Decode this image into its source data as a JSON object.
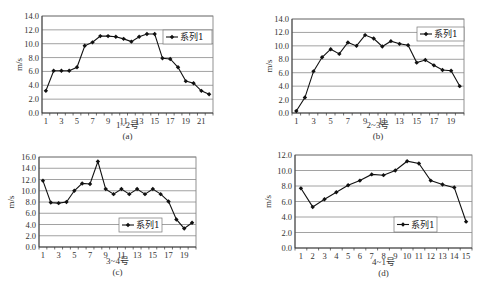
{
  "chart_data": [
    {
      "type": "line",
      "id": "a",
      "caption": "(a)",
      "xlabel": "1~2号",
      "ylabel": "m/s",
      "ylim": [
        0,
        14
      ],
      "yticks": [
        0.0,
        2.0,
        4.0,
        6.0,
        8.0,
        10.0,
        12.0,
        14.0
      ],
      "x": [
        1,
        2,
        3,
        4,
        5,
        6,
        7,
        8,
        9,
        10,
        11,
        12,
        13,
        14,
        15,
        16,
        17,
        18,
        19,
        20,
        21,
        22
      ],
      "xtick_labels": [
        "1",
        "3",
        "5",
        "7",
        "9",
        "11",
        "13",
        "15",
        "17",
        "19",
        "21"
      ],
      "xtick_step": 2,
      "legend": "系列1",
      "legend_position": "upper right",
      "grid": true,
      "series": [
        {
          "name": "系列1",
          "values": [
            3.2,
            6.1,
            6.1,
            6.1,
            6.6,
            9.7,
            10.2,
            11.1,
            11.1,
            11.0,
            10.7,
            10.3,
            11.0,
            11.4,
            11.4,
            7.9,
            7.8,
            6.6,
            4.6,
            4.3,
            3.2,
            2.7
          ]
        }
      ]
    },
    {
      "type": "line",
      "id": "b",
      "caption": "(b)",
      "xlabel": "2~3号",
      "ylabel": "m/s",
      "ylim": [
        0,
        14
      ],
      "yticks": [
        0.0,
        2.0,
        4.0,
        6.0,
        8.0,
        10.0,
        12.0,
        14.0
      ],
      "x": [
        1,
        2,
        3,
        4,
        5,
        6,
        7,
        8,
        9,
        10,
        11,
        12,
        13,
        14,
        15,
        16,
        17,
        18,
        19,
        20
      ],
      "xtick_labels": [
        "1",
        "3",
        "5",
        "7",
        "9",
        "11",
        "13",
        "15",
        "17",
        "19"
      ],
      "xtick_step": 2,
      "legend": "系列1",
      "legend_position": "upper right",
      "grid": true,
      "series": [
        {
          "name": "系列1",
          "values": [
            0.3,
            2.3,
            6.2,
            8.3,
            9.5,
            8.8,
            10.5,
            10.0,
            11.6,
            11.1,
            9.9,
            10.7,
            10.3,
            10.1,
            7.5,
            7.9,
            7.1,
            6.4,
            6.3,
            4.0
          ]
        }
      ]
    },
    {
      "type": "line",
      "id": "c",
      "caption": "(c)",
      "xlabel": "3~4号",
      "ylabel": "m/s",
      "ylim": [
        0,
        16
      ],
      "yticks": [
        0.0,
        2.0,
        4.0,
        6.0,
        8.0,
        10.0,
        12.0,
        14.0,
        16.0
      ],
      "x": [
        1,
        2,
        3,
        4,
        5,
        6,
        7,
        8,
        9,
        10,
        11,
        12,
        13,
        14,
        15,
        16,
        17,
        18,
        19,
        20
      ],
      "xtick_labels": [
        "1",
        "3",
        "5",
        "7",
        "9",
        "11",
        "13",
        "15",
        "17",
        "19"
      ],
      "xtick_step": 2,
      "legend": "系列1",
      "legend_position": "lower right",
      "grid": true,
      "series": [
        {
          "name": "系列1",
          "values": [
            11.8,
            7.9,
            7.8,
            8.0,
            10.0,
            11.3,
            11.2,
            15.2,
            10.3,
            9.4,
            10.3,
            9.4,
            10.3,
            9.4,
            10.3,
            9.4,
            8.1,
            4.9,
            3.3,
            4.3
          ]
        }
      ]
    },
    {
      "type": "line",
      "id": "d",
      "caption": "(d)",
      "xlabel": "4~1号",
      "ylabel": "m/s",
      "ylim": [
        0,
        12
      ],
      "yticks": [
        0.0,
        2.0,
        4.0,
        6.0,
        8.0,
        10.0,
        12.0
      ],
      "x": [
        1,
        2,
        3,
        4,
        5,
        6,
        7,
        8,
        9,
        10,
        11,
        12,
        13,
        14,
        15
      ],
      "xtick_labels": [
        "1",
        "2",
        "3",
        "4",
        "5",
        "6",
        "7",
        "8",
        "9",
        "10",
        "11",
        "12",
        "13",
        "14",
        "15"
      ],
      "xtick_step": 1,
      "legend": "系列1",
      "legend_position": "lower right",
      "grid": true,
      "series": [
        {
          "name": "系列1",
          "values": [
            7.7,
            5.3,
            6.3,
            7.2,
            8.1,
            8.7,
            9.5,
            9.4,
            10.0,
            11.2,
            10.9,
            8.7,
            8.2,
            7.8,
            3.4
          ]
        }
      ]
    }
  ],
  "layout": {
    "panels": [
      {
        "plot": {
          "left": 42,
          "top": 16,
          "right": 213,
          "bottom": 113
        },
        "legend": {
          "x": 163,
          "y": 30,
          "w": 49,
          "h": 14
        },
        "xlabel_y": 128,
        "caption_y": 139,
        "ylabel_x": 22
      },
      {
        "plot": {
          "left": 292,
          "top": 19,
          "right": 464,
          "bottom": 113
        },
        "legend": {
          "x": 417,
          "y": 27,
          "w": 47,
          "h": 14
        },
        "xlabel_y": 128,
        "caption_y": 139,
        "ylabel_x": 272
      },
      {
        "plot": {
          "left": 39,
          "top": 157,
          "right": 196,
          "bottom": 247
        },
        "legend": {
          "x": 119,
          "y": 218,
          "w": 43,
          "h": 14
        },
        "xlabel_y": 264,
        "caption_y": 275,
        "ylabel_x": 14
      },
      {
        "plot": {
          "left": 295,
          "top": 155,
          "right": 472,
          "bottom": 248
        },
        "legend": {
          "x": 394,
          "y": 217,
          "w": 43,
          "h": 15
        },
        "xlabel_y": 265,
        "caption_y": 276,
        "ylabel_x": 271
      }
    ],
    "colors": {
      "line": "#111111",
      "grid": "#8a8a8a",
      "frame": "#777777",
      "marker": "#111111"
    }
  }
}
